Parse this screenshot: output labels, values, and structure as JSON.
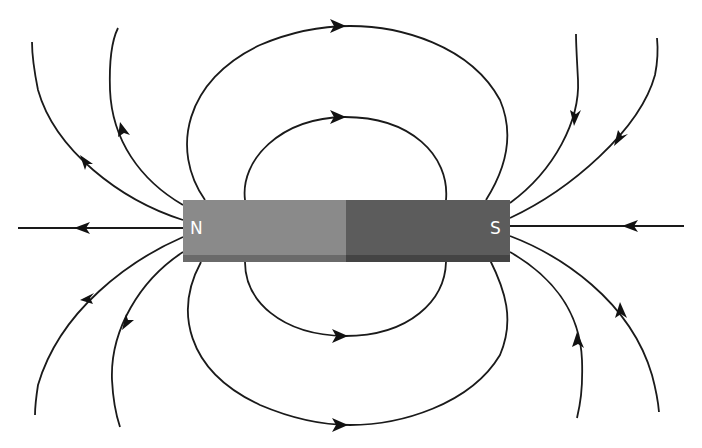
{
  "diagram": {
    "magnet": {
      "north_label": "N",
      "south_label": "S",
      "north_color": "#8a8a8a",
      "south_color": "#5c5c5c",
      "north_edge_color": "#6a6a6a",
      "south_edge_color": "#444444"
    },
    "field_lines": [
      {
        "id": "axis-left",
        "direction": "away-from-N"
      },
      {
        "id": "axis-right",
        "direction": "into-S"
      },
      {
        "id": "outer-loop-top",
        "direction": "N-to-S"
      },
      {
        "id": "inner-loop-top",
        "direction": "N-to-S"
      },
      {
        "id": "outer-loop-bottom",
        "direction": "N-to-S"
      },
      {
        "id": "inner-loop-bottom",
        "direction": "N-to-S"
      },
      {
        "id": "left-fan-1",
        "direction": "away-from-N"
      },
      {
        "id": "left-fan-2",
        "direction": "away-from-N"
      },
      {
        "id": "left-fan-3",
        "direction": "away-from-N"
      },
      {
        "id": "left-fan-4",
        "direction": "away-from-N"
      },
      {
        "id": "right-fan-1",
        "direction": "into-S"
      },
      {
        "id": "right-fan-2",
        "direction": "into-S"
      },
      {
        "id": "right-fan-3",
        "direction": "into-S"
      },
      {
        "id": "right-fan-4",
        "direction": "into-S"
      }
    ],
    "line_color": "#1a1a1a",
    "background": "#ffffff"
  }
}
